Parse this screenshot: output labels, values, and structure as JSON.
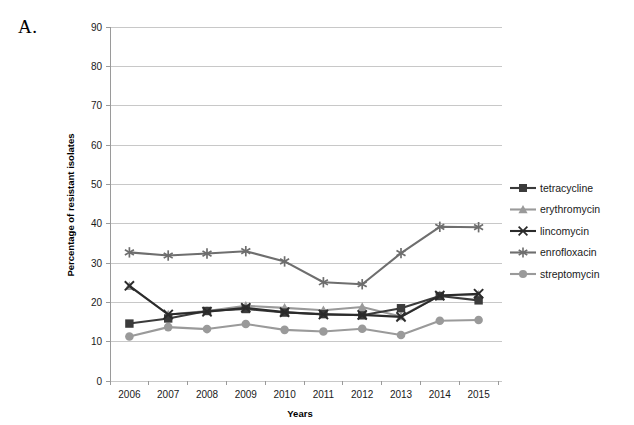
{
  "panel": {
    "label": "A."
  },
  "chart_data": {
    "type": "line",
    "title": "",
    "xlabel": "Years",
    "ylabel": "Percentage of resistant isolates",
    "categories": [
      "2006",
      "2007",
      "2008",
      "2009",
      "2010",
      "2011",
      "2012",
      "2013",
      "2014",
      "2015"
    ],
    "x": [
      2006,
      2007,
      2008,
      2009,
      2010,
      2011,
      2012,
      2013,
      2014,
      2015
    ],
    "ylim": [
      0,
      90
    ],
    "yticks": [
      0,
      10,
      20,
      30,
      40,
      50,
      60,
      70,
      80,
      90
    ],
    "ytick_labels": [
      "0",
      "10",
      "20",
      "30",
      "40",
      "50",
      "60",
      "70",
      "80",
      "90"
    ],
    "grid": "horizontal",
    "legend_position": "right",
    "series": [
      {
        "name": "tetracycline",
        "marker": "square",
        "color": "#3b3b3b",
        "values": [
          14.6,
          15.9,
          17.8,
          18.3,
          17.4,
          17.0,
          16.7,
          18.5,
          21.6,
          20.5
        ]
      },
      {
        "name": "erythromycin",
        "marker": "triangle",
        "color": "#9a9a9a",
        "values": [
          24.1,
          16.9,
          17.8,
          19.1,
          18.6,
          18.0,
          18.8,
          16.4,
          21.8,
          21.9
        ]
      },
      {
        "name": "lincomycin",
        "marker": "x",
        "color": "#2b2b2b",
        "values": [
          24.2,
          16.9,
          17.6,
          18.6,
          17.5,
          16.9,
          16.8,
          16.3,
          21.7,
          22.2
        ]
      },
      {
        "name": "enrofloxacin",
        "marker": "asterisk",
        "color": "#6e6e6e",
        "values": [
          32.7,
          31.9,
          32.4,
          33.0,
          30.4,
          25.1,
          24.6,
          32.5,
          39.2,
          39.1
        ]
      },
      {
        "name": "streptomycin",
        "marker": "circle",
        "color": "#9a9a9a",
        "values": [
          11.3,
          13.7,
          13.2,
          14.5,
          13.0,
          12.6,
          13.3,
          11.7,
          15.3,
          15.5
        ]
      }
    ]
  },
  "legend": {
    "items": [
      {
        "label": "tetracycline"
      },
      {
        "label": "erythromycin"
      },
      {
        "label": "lincomycin"
      },
      {
        "label": "enrofloxacin"
      },
      {
        "label": "streptomycin"
      }
    ]
  }
}
